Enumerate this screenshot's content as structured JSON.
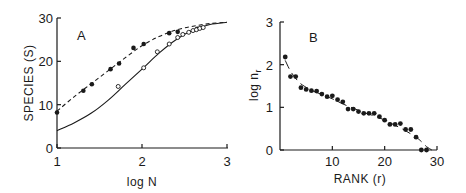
{
  "colors": {
    "ink": "#1a1a1a",
    "background": "#ffffff"
  },
  "chart_data": [
    {
      "panel": "A",
      "type": "line",
      "title": "",
      "panel_label": "A",
      "xlabel": "log N",
      "ylabel": "SPECIES (S)",
      "xlim": [
        1,
        3
      ],
      "ylim": [
        0,
        30
      ],
      "xticks": [
        1,
        2,
        3
      ],
      "xtick_labels": [
        "1",
        "2",
        "3"
      ],
      "yticks": [
        0,
        10,
        20,
        30
      ],
      "ytick_labels": [
        "0",
        "10",
        "20",
        "30"
      ],
      "grid": false,
      "legend": null,
      "series": [
        {
          "name": "filled points (observed)",
          "marker": "filled-circle",
          "x": [
            1.0,
            1.31,
            1.41,
            1.63,
            1.73,
            1.9,
            2.02,
            2.32,
            2.42,
            2.65
          ],
          "y": [
            8.2,
            13.2,
            14.7,
            18.2,
            19.5,
            23.1,
            24.0,
            26.5,
            26.8,
            27.5
          ]
        },
        {
          "name": "open points (observed)",
          "marker": "open-circle",
          "x": [
            1.72,
            2.02,
            2.18,
            2.32,
            2.42,
            2.48,
            2.55,
            2.6,
            2.64,
            2.68,
            2.72
          ],
          "y": [
            14.2,
            18.5,
            22.2,
            24.0,
            25.5,
            26.2,
            26.7,
            27.1,
            27.3,
            27.6,
            27.8
          ]
        },
        {
          "name": "dashed fitted curve",
          "style": "dashed",
          "x": [
            1.0,
            1.2,
            1.4,
            1.6,
            1.8,
            2.0,
            2.2,
            2.4,
            2.6,
            2.8,
            3.0
          ],
          "y": [
            8.5,
            11.8,
            14.8,
            17.8,
            20.8,
            23.6,
            25.7,
            27.2,
            28.1,
            28.7,
            29.0
          ]
        },
        {
          "name": "solid fitted curve",
          "style": "solid",
          "x": [
            1.0,
            1.2,
            1.4,
            1.6,
            1.8,
            2.0,
            2.2,
            2.4,
            2.6,
            2.8,
            3.0
          ],
          "y": [
            4.0,
            5.8,
            8.0,
            11.0,
            14.6,
            18.2,
            21.9,
            25.0,
            27.2,
            28.5,
            29.0
          ]
        }
      ]
    },
    {
      "panel": "B",
      "type": "scatter",
      "title": "",
      "panel_label": "B",
      "xlabel": "RANK (r)",
      "ylabel": "log n_r",
      "ylabel_main": "log n",
      "ylabel_sub": "r",
      "xlim": [
        0,
        30
      ],
      "ylim": [
        0,
        3
      ],
      "xticks": [
        10,
        20,
        30
      ],
      "xtick_labels": [
        "10",
        "20",
        "30"
      ],
      "yticks": [
        0,
        1,
        2,
        3
      ],
      "ytick_labels": [
        "0",
        "1",
        "2",
        "3"
      ],
      "grid": false,
      "legend": null,
      "series": [
        {
          "name": "observed log abundance by rank",
          "marker": "filled-circle",
          "x": [
            1,
            2,
            3,
            4,
            5,
            6,
            7,
            8,
            9,
            10,
            11,
            12,
            13,
            14,
            15,
            16,
            17,
            18,
            19,
            20,
            21,
            22,
            23,
            24,
            25,
            26,
            27,
            28
          ],
          "y": [
            2.18,
            1.72,
            1.72,
            1.46,
            1.42,
            1.39,
            1.38,
            1.31,
            1.25,
            1.27,
            1.18,
            1.13,
            0.96,
            0.96,
            0.9,
            0.86,
            0.86,
            0.86,
            0.78,
            0.7,
            0.6,
            0.6,
            0.62,
            0.48,
            0.48,
            0.3,
            0.0,
            0.0
          ]
        },
        {
          "name": "fitted curve",
          "style": "solid/dashed",
          "x": [
            1,
            2,
            3,
            4,
            6,
            8,
            10,
            12,
            14,
            16,
            18,
            20,
            22,
            24,
            26,
            27,
            28,
            29
          ],
          "y": [
            2.1,
            1.85,
            1.68,
            1.55,
            1.4,
            1.3,
            1.2,
            1.08,
            0.98,
            0.88,
            0.8,
            0.7,
            0.58,
            0.45,
            0.3,
            0.2,
            0.08,
            0.0
          ]
        }
      ]
    }
  ]
}
